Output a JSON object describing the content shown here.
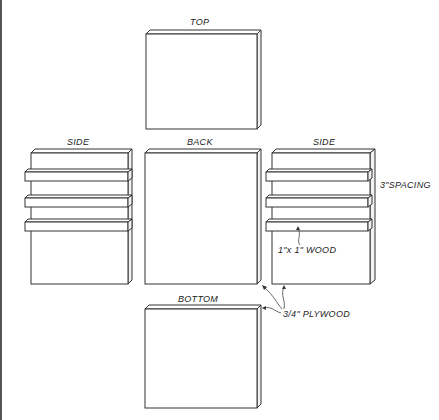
{
  "diagram": {
    "panels": [
      {
        "id": "top",
        "label": "TOP"
      },
      {
        "id": "side_left",
        "label": "SIDE"
      },
      {
        "id": "back",
        "label": "BACK"
      },
      {
        "id": "side_right",
        "label": "SIDE"
      },
      {
        "id": "bottom",
        "label": "BOTTOM"
      }
    ],
    "annotations": {
      "spacing": "3\"SPACING",
      "wood": "1\"x 1\" WOOD",
      "plywood": "3/4\" PLYWOOD"
    },
    "colors": {
      "line": "#333333",
      "background": "#ffffff"
    }
  }
}
